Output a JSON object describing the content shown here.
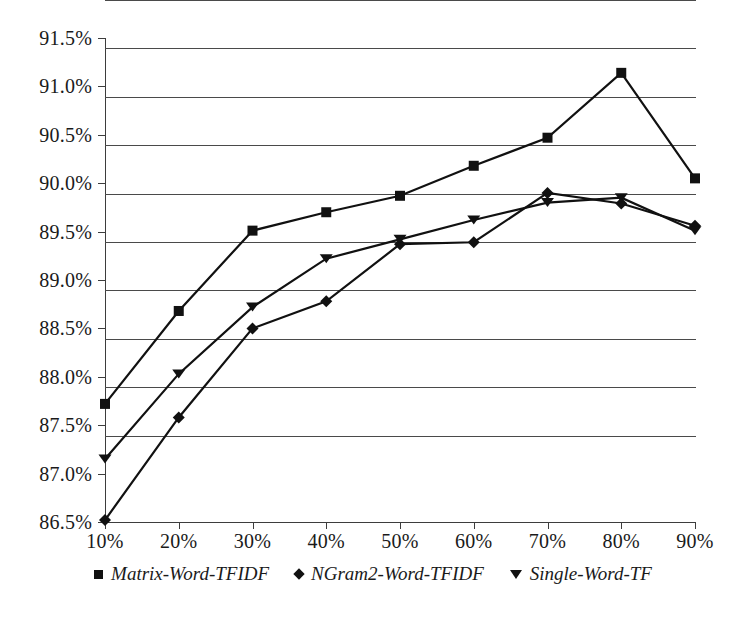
{
  "chart_data": {
    "type": "line",
    "title": "",
    "xlabel": "",
    "ylabel": "",
    "categories": [
      "10%",
      "20%",
      "30%",
      "40%",
      "50%",
      "60%",
      "70%",
      "80%",
      "90%"
    ],
    "x_tick_labels": [
      "10%",
      "20%",
      "30%",
      "40%",
      "50%",
      "60%",
      "70%",
      "80%",
      "90%"
    ],
    "y_tick_labels": [
      "86.5%",
      "87.0%",
      "87.5%",
      "88.0%",
      "88.5%",
      "89.0%",
      "89.5%",
      "90.0%",
      "90.5%",
      "91.0%",
      "91.5%"
    ],
    "ylim": [
      86.5,
      91.5
    ],
    "y_tick_step": 0.5,
    "grid": "horizontal",
    "legend_position": "bottom",
    "series": [
      {
        "name": "Matrix-Word-TFIDF",
        "marker": "square",
        "color": "#111111",
        "values": [
          87.72,
          88.68,
          89.51,
          89.7,
          89.87,
          90.18,
          90.47,
          91.14,
          90.05
        ]
      },
      {
        "name": "NGram2-Word-TFIDF",
        "marker": "diamond",
        "color": "#111111",
        "values": [
          86.52,
          87.58,
          88.5,
          88.78,
          89.37,
          89.39,
          89.9,
          89.79,
          89.56
        ]
      },
      {
        "name": "Single-Word-TF",
        "marker": "triangle-down",
        "color": "#111111",
        "values": [
          87.15,
          88.03,
          88.72,
          89.22,
          89.42,
          89.62,
          89.8,
          89.85,
          89.51
        ]
      }
    ]
  },
  "legend": {
    "items": [
      {
        "label": "Matrix-Word-TFIDF",
        "marker": "square"
      },
      {
        "label": "NGram2-Word-TFIDF",
        "marker": "diamond"
      },
      {
        "label": "Single-Word-TF",
        "marker": "triangle-down"
      }
    ]
  },
  "colors": {
    "line": "#111111",
    "grid": "#4a4a4a",
    "axis": "#3d3d3d",
    "text": "#1a1a1a",
    "background": "#ffffff"
  }
}
